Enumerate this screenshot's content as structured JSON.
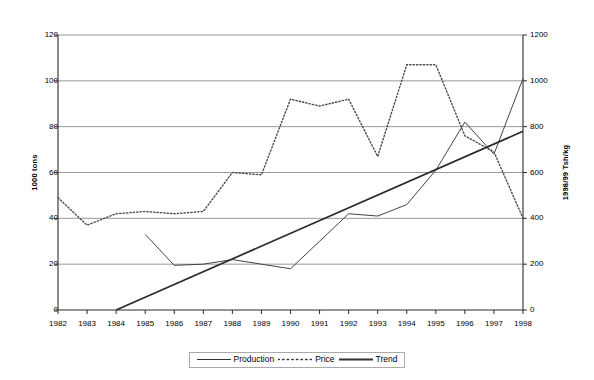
{
  "chart_data": {
    "type": "line",
    "title": "",
    "subtitle": "",
    "xlabel": "",
    "ylabel": "1000 tons",
    "y2label": "1998/99 Tsh/kg",
    "categories": [
      "1982",
      "1983",
      "1984",
      "1985",
      "1986",
      "1987",
      "1988",
      "1989",
      "1990",
      "1991",
      "1992",
      "1993",
      "1994",
      "1995",
      "1996",
      "1997",
      "1998"
    ],
    "ylim": [
      0,
      120
    ],
    "yticks": [
      0,
      20,
      40,
      60,
      80,
      100,
      120
    ],
    "y2lim": [
      0,
      1200
    ],
    "y2ticks": [
      0,
      200,
      400,
      600,
      800,
      1000,
      1200
    ],
    "grid": true,
    "grid_axis": "y",
    "legend_position": "bottom-center",
    "series": [
      {
        "name": "Production",
        "axis": "left",
        "style": "solid-thin",
        "color": "#3a3a3a",
        "x": [
          "1985",
          "1986",
          "1987",
          "1988",
          "1989",
          "1990",
          "1991",
          "1992",
          "1993",
          "1994",
          "1995",
          "1996",
          "1997",
          "1998"
        ],
        "values": [
          33,
          19.5,
          20,
          22,
          20,
          18,
          30,
          42,
          41,
          46,
          61,
          82,
          68,
          101
        ]
      },
      {
        "name": "Price",
        "axis": "right",
        "style": "dotted",
        "color": "#4a4a4a",
        "x": [
          "1982",
          "1983",
          "1984",
          "1985",
          "1986",
          "1987",
          "1988",
          "1989",
          "1990",
          "1991",
          "1992",
          "1993",
          "1994",
          "1995",
          "1996",
          "1997",
          "1998"
        ],
        "values": [
          49,
          37,
          42,
          43,
          42,
          43,
          60,
          59,
          92,
          89,
          92,
          67,
          107,
          107,
          76,
          69,
          40
        ],
        "values_right_axis": [
          490,
          370,
          420,
          430,
          420,
          430,
          600,
          590,
          920,
          890,
          920,
          670,
          1070,
          1070,
          760,
          690,
          400
        ]
      },
      {
        "name": "Trend",
        "axis": "left",
        "style": "solid-thick",
        "color": "#2a2a2a",
        "x": [
          "1984",
          "1998"
        ],
        "values": [
          0,
          78
        ]
      }
    ]
  },
  "legend": {
    "items": [
      {
        "label": "Production",
        "marker": "solid-thin-line-icon"
      },
      {
        "label": "Price",
        "marker": "dotted-line-icon"
      },
      {
        "label": "Trend",
        "marker": "solid-thick-line-icon"
      }
    ]
  }
}
